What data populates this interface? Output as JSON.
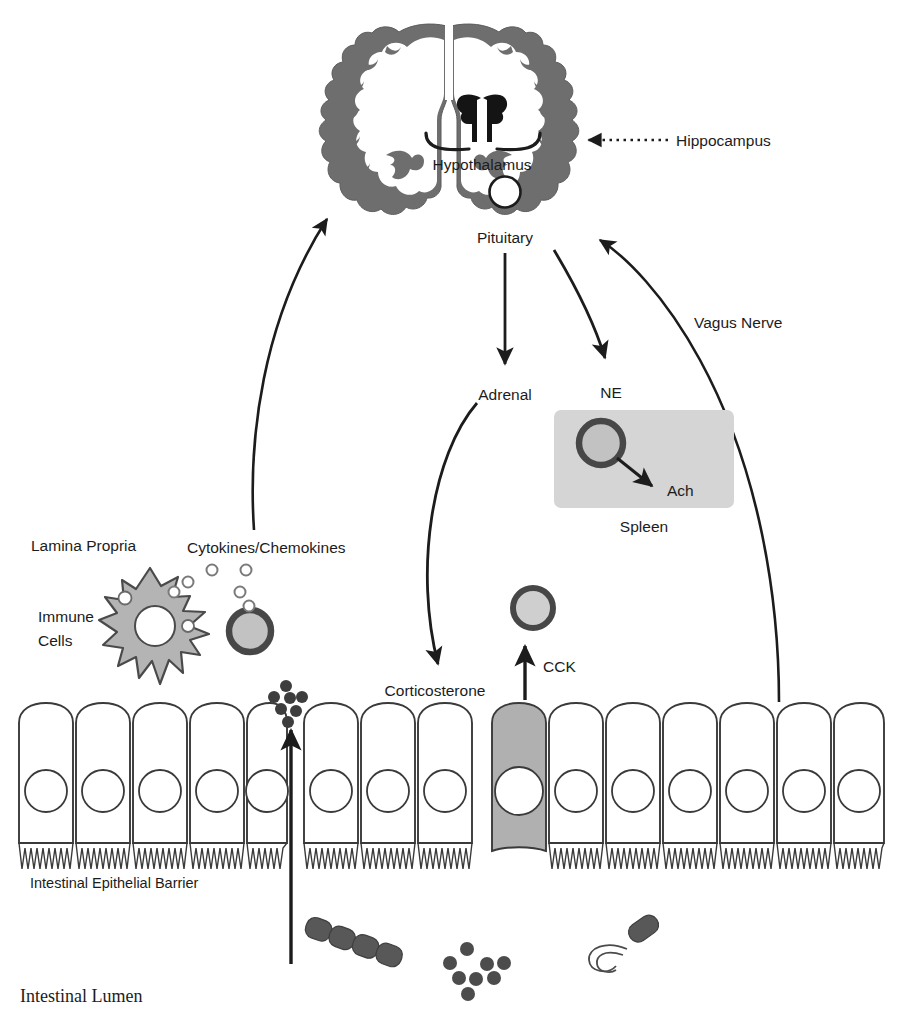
{
  "figure": {
    "background_color": "#ffffff"
  },
  "colors": {
    "ink": "#1c1c1c",
    "cortex_gray": "#6e6e6e",
    "cortex_dark": "#4a4a4a",
    "thalamus_black": "#141414",
    "spleen_box_gray": "#d5d5d5",
    "cell_fill_gray": "#bdbdbd",
    "immune_cell_gray": "#b4b4b4",
    "epithelial_shaded": "#b0b0b0",
    "bacteria_gray": "#5a5a5a",
    "dot_dark": "#3d3d3d",
    "outline": "#2b2b2b"
  },
  "labels": {
    "hypothalamus": "Hypothalamus",
    "hippocampus": "Hippocampus",
    "pituitary": "Pituitary",
    "adrenal": "Adrenal",
    "ne": "NE",
    "ach": "Ach",
    "spleen": "Spleen",
    "vagus_nerve": "Vagus Nerve",
    "corticosterone": "Corticosterone",
    "cck": "CCK",
    "lamina_propria": "Lamina Propria",
    "cytokines_chemokines": "Cytokines/Chemokines",
    "immune_cells_line1": "Immune",
    "immune_cells_line2": "Cells",
    "intestinal_epithelial_barrier": "Intestinal Epithelial Barrier",
    "intestinal_lumen": "Intestinal Lumen"
  },
  "structures": [
    {
      "name": "brain-coronal-section",
      "label": "Brain (coronal section)"
    },
    {
      "name": "hypothalamus-structure",
      "label": "Hypothalamus"
    },
    {
      "name": "pituitary-gland",
      "label": "Pituitary"
    },
    {
      "name": "spleen-box",
      "label": "Spleen"
    },
    {
      "name": "macrophage-immune-cell",
      "label": "Immune Cells"
    },
    {
      "name": "enteroendocrine-cell",
      "label": "CCK-secreting epithelial cell"
    },
    {
      "name": "intestinal-epithelium",
      "label": "Intestinal Epithelial Barrier"
    },
    {
      "name": "intestinal-lumen-region",
      "label": "Intestinal Lumen"
    }
  ],
  "arrows": [
    {
      "name": "cytokines-to-brain-arrow",
      "from": "Lamina Propria",
      "to": "Brain",
      "style": "curved-solid"
    },
    {
      "name": "hippocampus-pointer-arrow",
      "from": "Hippocampus label",
      "to": "Hippocampus region",
      "style": "dotted"
    },
    {
      "name": "pituitary-to-adrenal-arrow",
      "from": "Pituitary",
      "to": "Adrenal",
      "style": "straight-solid"
    },
    {
      "name": "pituitary-to-ne-arrow",
      "from": "Pituitary",
      "to": "NE",
      "style": "curved-solid"
    },
    {
      "name": "adrenal-to-corticosterone-arrow",
      "from": "Adrenal",
      "to": "Corticosterone",
      "style": "curved-solid"
    },
    {
      "name": "vagus-nerve-arrow",
      "from": "Intestine",
      "to": "Brain",
      "style": "curved-solid"
    },
    {
      "name": "cck-arrow",
      "from": "Enteroendocrine cell",
      "to": "CCK",
      "style": "straight-solid"
    },
    {
      "name": "bacterial-translocation-arrow",
      "from": "Intestinal Lumen",
      "to": "Lamina Propria",
      "style": "straight-solid"
    },
    {
      "name": "ne-to-ach-arrow",
      "from": "Spleen cell",
      "to": "Ach",
      "style": "straight-solid"
    }
  ],
  "microbes": [
    {
      "name": "rod-chain-bacterium",
      "shape": "rod chain",
      "segments": 4
    },
    {
      "name": "coccus-cluster",
      "shape": "cocci cluster",
      "count": 8
    },
    {
      "name": "flagellated-rod-bacterium",
      "shape": "rod with flagellum",
      "segments": 1
    }
  ]
}
